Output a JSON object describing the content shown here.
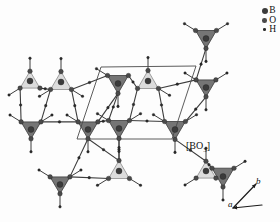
{
  "figure": {
    "kind": "crystal-structure-projection",
    "background": "#fdfdfd",
    "width": 280,
    "height": 222
  },
  "legend": {
    "position": "top-right",
    "entries": [
      {
        "symbol": "B",
        "label": "B",
        "marker": "large-dark-circle",
        "color": "#3b3b3b",
        "radius": 3.0
      },
      {
        "symbol": "O",
        "label": "O",
        "marker": "medium-circle",
        "color": "#4a4a4a",
        "radius": 2.3
      },
      {
        "symbol": "H",
        "label": "H",
        "marker": "small-dot",
        "color": "#2b2b2b",
        "radius": 1.3
      }
    ]
  },
  "annotations": {
    "polyhedron_label": "[BO",
    "polyhedron_label_sub": "3",
    "polyhedron_label_tail": "]",
    "polyhedron_label_full": "[BO3]"
  },
  "axes": {
    "a_label": "a",
    "b_label": "b",
    "a_arrow": {
      "x1": 262,
      "y1": 205,
      "x2": 233,
      "y2": 208
    },
    "b_arrow": {
      "x1": 233,
      "y1": 208,
      "x2": 256,
      "y2": 184
    }
  },
  "unit_cell": {
    "name": "unit-cell-parallelogram",
    "stroke": "#4a4a4a",
    "stroke_width": 0.9,
    "points": "101,67 196,66 172,139 77,139"
  },
  "colors": {
    "triangle_dark_fill": "#6e6e6e",
    "triangle_dark_stroke": "#3a3a3a",
    "triangle_light_fill": "#d8d8d8",
    "triangle_light_stroke": "#8a8a8a",
    "bond_stroke": "#3d3d3d",
    "atom_b": "#3b3b3b",
    "atom_o": "#4a4a4a",
    "atom_h": "#2b2b2b"
  },
  "chart_data": {
    "type": "scatter",
    "title": "",
    "xlabel": "a",
    "ylabel": "b",
    "triangles_dark": [
      {
        "cx": 206,
        "cy": 37,
        "size": 19,
        "dir": "down"
      },
      {
        "cx": 119,
        "cy": 127,
        "size": 19,
        "dir": "down"
      },
      {
        "cx": 88,
        "cy": 128,
        "size": 18,
        "dir": "down"
      },
      {
        "cx": 31,
        "cy": 128,
        "size": 18,
        "dir": "down"
      },
      {
        "cx": 175,
        "cy": 128,
        "size": 19,
        "dir": "down"
      },
      {
        "cx": 118,
        "cy": 82,
        "size": 19,
        "dir": "down"
      },
      {
        "cx": 223,
        "cy": 175,
        "size": 20,
        "dir": "down"
      },
      {
        "cx": 60,
        "cy": 183,
        "size": 18,
        "dir": "down"
      },
      {
        "cx": 206,
        "cy": 86,
        "size": 18,
        "dir": "down"
      }
    ],
    "triangles_light": [
      {
        "cx": 61,
        "cy": 83,
        "size": 19,
        "dir": "up"
      },
      {
        "cx": 148,
        "cy": 82,
        "size": 19,
        "dir": "up"
      },
      {
        "cx": 119,
        "cy": 172,
        "size": 19,
        "dir": "up"
      },
      {
        "cx": 30,
        "cy": 82,
        "size": 18,
        "dir": "up"
      },
      {
        "cx": 206,
        "cy": 172,
        "size": 18,
        "dir": "up"
      }
    ]
  }
}
